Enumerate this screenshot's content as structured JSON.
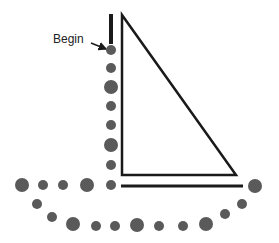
{
  "diagram": {
    "start_label": "Begin",
    "colors": {
      "line": "#1a1a1a",
      "dot": "#5a5a5a"
    },
    "left_bar": {
      "x": 111,
      "y1": 14,
      "y2": 44
    },
    "triangle": {
      "points": [
        [
          122,
          15
        ],
        [
          122,
          175
        ],
        [
          236,
          175
        ]
      ]
    },
    "baseline": {
      "x1": 121,
      "x2": 243,
      "y": 186
    },
    "arrow": {
      "x1": 91,
      "y1": 43,
      "x2": 106,
      "y2": 49
    },
    "dots": [
      {
        "x": 111,
        "y": 50,
        "r": 5
      },
      {
        "x": 111,
        "y": 68,
        "r": 5
      },
      {
        "x": 111,
        "y": 87,
        "r": 7
      },
      {
        "x": 111,
        "y": 106,
        "r": 5
      },
      {
        "x": 111,
        "y": 125,
        "r": 5
      },
      {
        "x": 111,
        "y": 145,
        "r": 7
      },
      {
        "x": 111,
        "y": 165,
        "r": 5
      },
      {
        "x": 111,
        "y": 185,
        "r": 5
      },
      {
        "x": 87,
        "y": 185,
        "r": 7
      },
      {
        "x": 63,
        "y": 185,
        "r": 5
      },
      {
        "x": 43,
        "y": 185,
        "r": 5
      },
      {
        "x": 22,
        "y": 185,
        "r": 7
      },
      {
        "x": 37,
        "y": 204,
        "r": 5
      },
      {
        "x": 52,
        "y": 217,
        "r": 5
      },
      {
        "x": 73,
        "y": 224,
        "r": 7
      },
      {
        "x": 96,
        "y": 226,
        "r": 5
      },
      {
        "x": 115,
        "y": 226,
        "r": 5
      },
      {
        "x": 137,
        "y": 225,
        "r": 7
      },
      {
        "x": 159,
        "y": 226,
        "r": 5
      },
      {
        "x": 183,
        "y": 226,
        "r": 5
      },
      {
        "x": 206,
        "y": 224,
        "r": 7
      },
      {
        "x": 225,
        "y": 214,
        "r": 5
      },
      {
        "x": 242,
        "y": 204,
        "r": 5
      },
      {
        "x": 255,
        "y": 186,
        "r": 7
      }
    ]
  }
}
